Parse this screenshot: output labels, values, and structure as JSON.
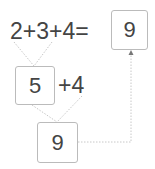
{
  "equation": {
    "expression": "2+3+4=",
    "result": "9"
  },
  "step1": {
    "partial_sum": "5",
    "remainder": "+4"
  },
  "step2": {
    "result": "9"
  },
  "colors": {
    "text": "#444444",
    "box_border": "#bbbbbb",
    "connector": "#c8c8c8"
  }
}
